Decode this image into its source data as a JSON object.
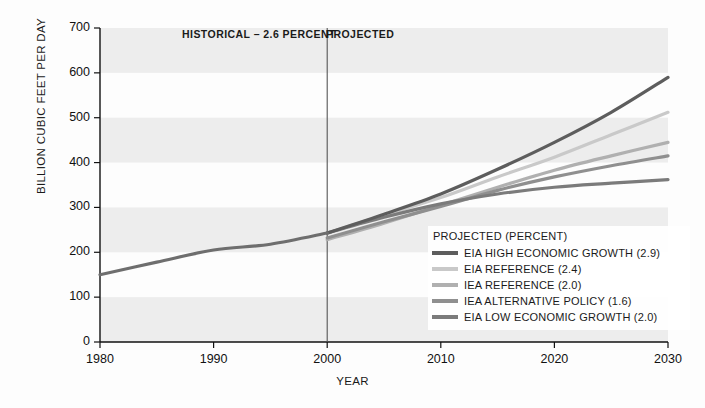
{
  "chart_data": {
    "type": "line",
    "title": "",
    "xlabel": "YEAR",
    "ylabel": "BILLION CUBIC FEET PER DAY",
    "xlim": [
      1980,
      2030
    ],
    "ylim": [
      0,
      700
    ],
    "xticks": [
      "1980",
      "1990",
      "2000",
      "2010",
      "2020",
      "2030"
    ],
    "yticks": [
      "0",
      "100",
      "200",
      "300",
      "400",
      "500",
      "600",
      "700"
    ],
    "grid": "horizontal-bands",
    "legend_position": "inside-bottom-right",
    "annotations": [
      {
        "text": "HISTORICAL – 2.6 PERCENT",
        "x": 1990
      },
      {
        "text": "PROJECTED",
        "x": 2003
      }
    ],
    "divider_year": 2000,
    "historical": {
      "name": "HISTORICAL",
      "color": "#6e6e6e",
      "x": [
        1980,
        1985,
        1990,
        1995,
        2000
      ],
      "values": [
        150,
        178,
        205,
        218,
        243
      ]
    },
    "series": [
      {
        "name": "EIA HIGH ECONOMIC GROWTH (2.9)",
        "color": "#5d5d5d",
        "x": [
          2000,
          2005,
          2010,
          2015,
          2020,
          2025,
          2030
        ],
        "values": [
          243,
          285,
          330,
          385,
          445,
          512,
          590
        ]
      },
      {
        "name": "EIA REFERENCE (2.4)",
        "color": "#c9c9c9",
        "x": [
          2000,
          2005,
          2010,
          2015,
          2020,
          2025,
          2030
        ],
        "values": [
          243,
          283,
          322,
          368,
          412,
          462,
          512
        ]
      },
      {
        "name": "IEA REFERENCE (2.0)",
        "color": "#b0b0b0",
        "x": [
          2000,
          2005,
          2010,
          2015,
          2020,
          2025,
          2030
        ],
        "values": [
          228,
          265,
          305,
          345,
          383,
          415,
          445
        ]
      },
      {
        "name": "IEA ALTERNATIVE POLICY (1.6)",
        "color": "#8f8f8f",
        "x": [
          2000,
          2005,
          2010,
          2015,
          2020,
          2025,
          2030
        ],
        "values": [
          232,
          268,
          302,
          338,
          368,
          393,
          415
        ]
      },
      {
        "name": "EIA LOW ECONOMIC GROWTH (2.0)",
        "color": "#7b7b7b",
        "x": [
          2000,
          2005,
          2010,
          2015,
          2020,
          2025,
          2030
        ],
        "values": [
          243,
          278,
          308,
          330,
          345,
          354,
          362
        ]
      }
    ]
  },
  "legend": {
    "title": "PROJECTED (PERCENT)",
    "entries": [
      {
        "label": "EIA HIGH ECONOMIC GROWTH (2.9)",
        "color": "#5d5d5d"
      },
      {
        "label": "EIA REFERENCE (2.4)",
        "color": "#c9c9c9"
      },
      {
        "label": "IEA REFERENCE (2.0)",
        "color": "#b0b0b0"
      },
      {
        "label": "IEA ALTERNATIVE POLICY (1.6)",
        "color": "#8f8f8f"
      },
      {
        "label": "EIA LOW ECONOMIC GROWTH (2.0)",
        "color": "#7b7b7b"
      }
    ]
  },
  "colors": {
    "band": "#ededed",
    "axis": "#111111",
    "divider": "#555555",
    "background": "#fdfdfd"
  }
}
